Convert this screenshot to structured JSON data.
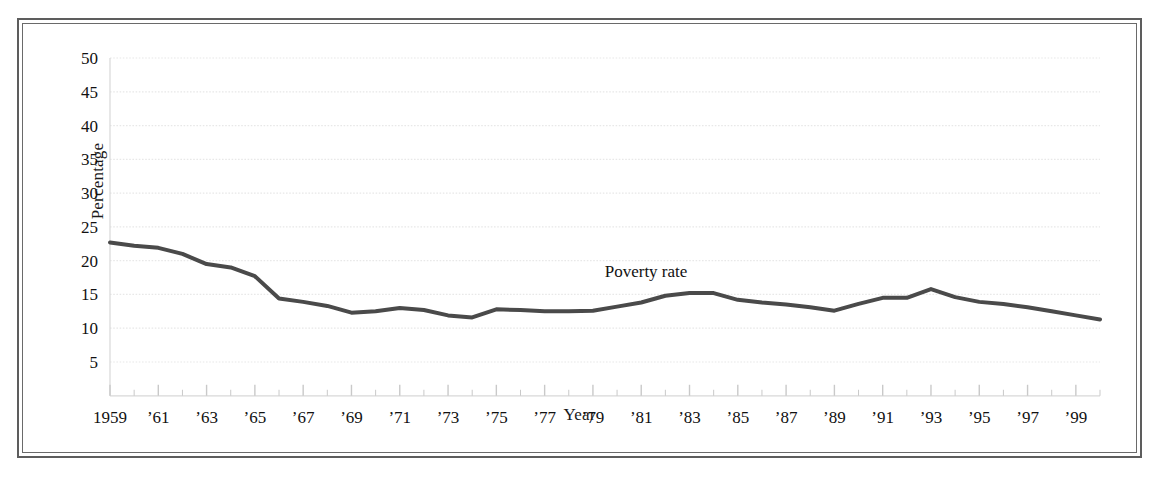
{
  "figure": {
    "frame_style": "double-rule",
    "background_color": "#ffffff"
  },
  "chart_data": {
    "type": "line",
    "title": "",
    "xlabel": "Year",
    "ylabel": "Percentage",
    "xlim": [
      1959,
      2000
    ],
    "ylim": [
      0,
      50
    ],
    "yticks": [
      5,
      10,
      15,
      20,
      25,
      30,
      35,
      40,
      45,
      50
    ],
    "ytick_labels": [
      "5",
      "10",
      "15",
      "20",
      "25",
      "30",
      "35",
      "40",
      "45",
      "50"
    ],
    "xticks": [
      1959,
      1961,
      1963,
      1965,
      1967,
      1969,
      1971,
      1973,
      1975,
      1977,
      1979,
      1981,
      1983,
      1985,
      1987,
      1989,
      1991,
      1993,
      1995,
      1997,
      1999
    ],
    "xtick_labels": [
      "1959",
      "’61",
      "’63",
      "’65",
      "’67",
      "’69",
      "’71",
      "’73",
      "’75",
      "’77",
      "’79",
      "’81",
      "’83",
      "’85",
      "’87",
      "’89",
      "’91",
      "’93",
      "’95",
      "’97",
      "’99"
    ],
    "minor_xticks_interval": 1,
    "grid": "horizontal-dotted",
    "grid_color": "#e8e8e8",
    "legend": "inline-annotation",
    "annotations": [
      {
        "text": "Poverty rate",
        "x": 1981.2,
        "y": 17.6
      }
    ],
    "series": [
      {
        "name": "Poverty rate",
        "color": "#4a4a4a",
        "line_width": 4,
        "x": [
          1959,
          1960,
          1961,
          1962,
          1963,
          1964,
          1965,
          1966,
          1967,
          1968,
          1969,
          1970,
          1971,
          1972,
          1973,
          1974,
          1975,
          1976,
          1977,
          1978,
          1979,
          1980,
          1981,
          1982,
          1983,
          1984,
          1985,
          1986,
          1987,
          1988,
          1989,
          1990,
          1991,
          1992,
          1993,
          1994,
          1995,
          1996,
          1997,
          1998,
          1999,
          2000
        ],
        "values": [
          22.7,
          22.2,
          21.9,
          21.0,
          19.5,
          19.0,
          17.7,
          14.4,
          13.9,
          13.3,
          12.3,
          12.5,
          13.0,
          12.7,
          11.9,
          11.6,
          12.8,
          12.7,
          12.5,
          12.5,
          12.6,
          13.2,
          13.8,
          14.8,
          15.2,
          15.2,
          14.2,
          13.8,
          13.5,
          13.1,
          12.6,
          13.6,
          14.5,
          14.5,
          15.8,
          14.6,
          13.9,
          13.6,
          13.1,
          12.5,
          11.9,
          11.3
        ]
      }
    ]
  }
}
